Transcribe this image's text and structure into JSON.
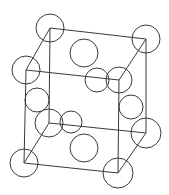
{
  "diagram": {
    "type": "crystal-unit-cell",
    "stroke_color": "#3a3a3a",
    "background": "#ffffff",
    "cell_vertices": {
      "back_top_left": [
        50,
        28
      ],
      "back_top_right": [
        146,
        39
      ],
      "front_top_left": [
        26,
        70
      ],
      "front_top_right": [
        119,
        80
      ],
      "back_bottom_left": [
        49,
        123
      ],
      "back_bottom_right": [
        146,
        133
      ],
      "front_bottom_left": [
        24,
        163
      ],
      "front_bottom_right": [
        118,
        173
      ]
    },
    "edges": [
      [
        "back_top_left",
        "back_top_right"
      ],
      [
        "back_top_left",
        "front_top_left"
      ],
      [
        "back_top_right",
        "front_top_right"
      ],
      [
        "front_top_left",
        "front_top_right"
      ],
      [
        "back_bottom_left",
        "back_bottom_right"
      ],
      [
        "back_bottom_left",
        "front_bottom_left"
      ],
      [
        "back_bottom_right",
        "front_bottom_right"
      ],
      [
        "front_bottom_left",
        "front_bottom_right"
      ],
      [
        "back_top_left",
        "back_bottom_left"
      ],
      [
        "back_top_right",
        "back_bottom_right"
      ],
      [
        "front_top_left",
        "front_bottom_left"
      ],
      [
        "front_top_right",
        "front_bottom_right"
      ]
    ],
    "atoms": [
      {
        "role": "corner",
        "cx": 50,
        "cy": 28,
        "r": 14
      },
      {
        "role": "corner",
        "cx": 146,
        "cy": 39,
        "r": 14
      },
      {
        "role": "corner",
        "cx": 26,
        "cy": 70,
        "r": 14
      },
      {
        "role": "corner",
        "cx": 119,
        "cy": 80,
        "r": 13
      },
      {
        "role": "corner",
        "cx": 49,
        "cy": 123,
        "r": 14
      },
      {
        "role": "corner",
        "cx": 146,
        "cy": 133,
        "r": 15
      },
      {
        "role": "corner",
        "cx": 24,
        "cy": 163,
        "r": 14
      },
      {
        "role": "corner",
        "cx": 118,
        "cy": 173,
        "r": 15
      },
      {
        "role": "face-center-top",
        "cx": 84,
        "cy": 53,
        "r": 14
      },
      {
        "role": "face-center-front",
        "cx": 97,
        "cy": 80,
        "r": 12
      },
      {
        "role": "face-center-left",
        "cx": 37,
        "cy": 100,
        "r": 12
      },
      {
        "role": "face-center-back",
        "cx": 71,
        "cy": 122,
        "r": 11
      },
      {
        "role": "face-center-right",
        "cx": 131,
        "cy": 107,
        "r": 12
      },
      {
        "role": "face-center-bottom",
        "cx": 84,
        "cy": 148,
        "r": 14
      }
    ]
  }
}
